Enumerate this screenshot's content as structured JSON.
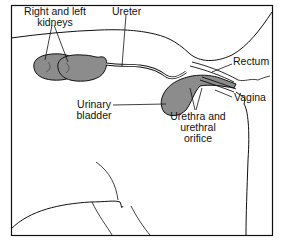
{
  "diagram": {
    "labels": {
      "kidneys_line1": "Right and left",
      "kidneys_line2": "kidneys",
      "ureter": "Ureter",
      "rectum": "Rectum",
      "vagina": "Vagina",
      "bladder_line1": "Urinary",
      "bladder_line2": "bladder",
      "urethra_line1": "Urethra and",
      "urethra_line2": "urethral",
      "urethra_line3": "orifice"
    },
    "colors": {
      "organ_fill": "#8c8c8c",
      "line": "#111111",
      "background": "#ffffff"
    }
  }
}
